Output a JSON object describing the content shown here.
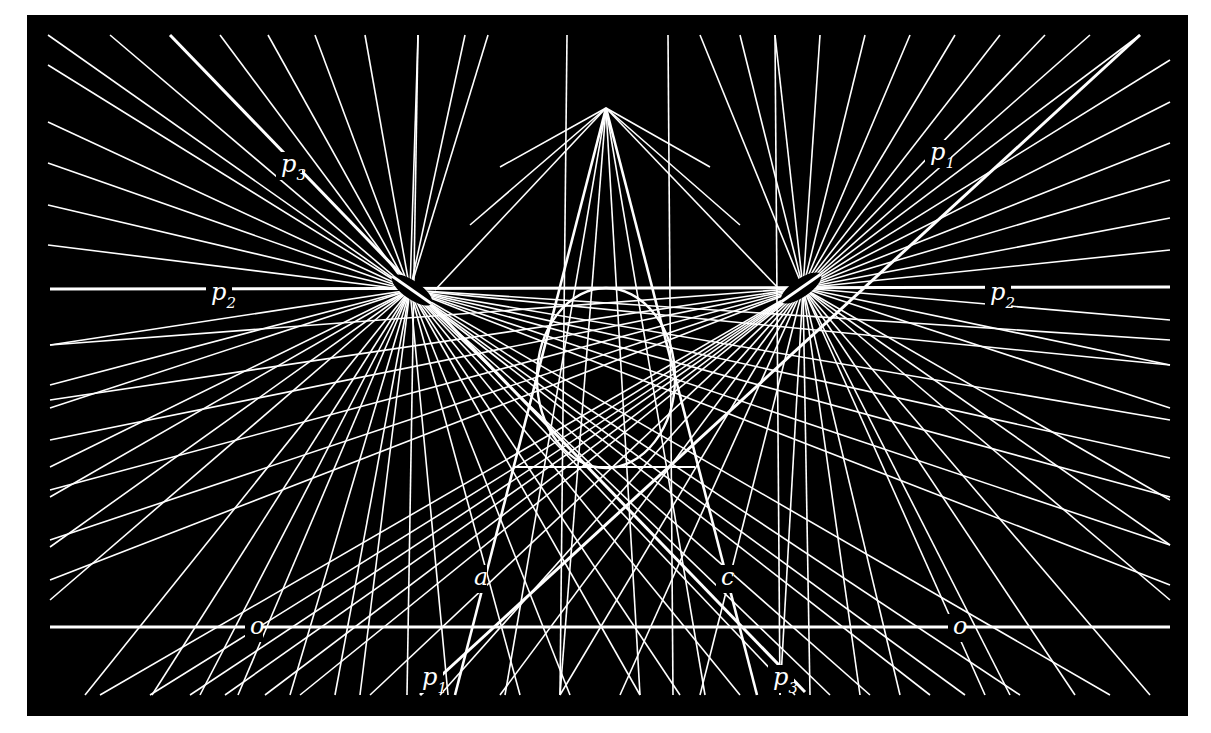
{
  "figure": {
    "background": "#ffffff",
    "panel": {
      "x": 27,
      "y": 15,
      "width": 1161,
      "height": 701,
      "color": "#000000"
    },
    "stroke_color": "#ffffff"
  },
  "points": {
    "pole_left": {
      "x": 410,
      "y": 290
    },
    "pole_right": {
      "x": 803,
      "y": 288
    },
    "apex": {
      "x": 606,
      "y": 108
    }
  },
  "pole_marks": [
    {
      "name": "pole-left-mark",
      "cx": 412,
      "cy": 290,
      "rx": 24,
      "ry": 9,
      "rotate": 35
    },
    {
      "name": "pole-right-mark",
      "cx": 801,
      "cy": 288,
      "rx": 24,
      "ry": 9,
      "rotate": -35
    }
  ],
  "ellipse": {
    "cx": 606,
    "cy": 378,
    "rx": 69,
    "ry": 90
  },
  "thick_lines": [
    {
      "name": "line-o",
      "x1": 50,
      "y1": 627,
      "x2": 1170,
      "y2": 627,
      "w": 3
    },
    {
      "name": "line-p2",
      "x1": 50,
      "y1": 289,
      "x2": 1170,
      "y2": 287,
      "w": 3
    },
    {
      "name": "line-p1",
      "x1": 420,
      "y1": 695,
      "x2": 1140,
      "y2": 35,
      "w": 3
    },
    {
      "name": "line-p3",
      "x1": 170,
      "y1": 35,
      "x2": 805,
      "y2": 692,
      "w": 3
    },
    {
      "name": "line-a",
      "x1": 455,
      "y1": 695,
      "x2": 606,
      "y2": 108,
      "w": 2.6
    },
    {
      "name": "line-c",
      "x1": 757,
      "y1": 695,
      "x2": 606,
      "y2": 108,
      "w": 2.6
    },
    {
      "name": "ellipse-top-tangent",
      "x1": 515,
      "y1": 467,
      "x2": 695,
      "y2": 467,
      "w": 2
    }
  ],
  "pencil_left_ends": [
    [
      48,
      35
    ],
    [
      110,
      35
    ],
    [
      220,
      35
    ],
    [
      268,
      35
    ],
    [
      315,
      35
    ],
    [
      365,
      35
    ],
    [
      418,
      35
    ],
    [
      465,
      35
    ],
    [
      488,
      35
    ],
    [
      48,
      65
    ],
    [
      48,
      122
    ],
    [
      48,
      163
    ],
    [
      48,
      205
    ],
    [
      48,
      245
    ],
    [
      50,
      345
    ],
    [
      50,
      385
    ],
    [
      50,
      408
    ],
    [
      50,
      467
    ],
    [
      50,
      497
    ],
    [
      50,
      547
    ],
    [
      50,
      600
    ],
    [
      85,
      695
    ],
    [
      152,
      695
    ],
    [
      200,
      695
    ],
    [
      238,
      695
    ],
    [
      290,
      695
    ],
    [
      335,
      695
    ],
    [
      360,
      695
    ],
    [
      448,
      695
    ],
    [
      520,
      695
    ],
    [
      1170,
      340
    ],
    [
      1170,
      365
    ],
    [
      1170,
      420
    ],
    [
      1170,
      458
    ],
    [
      1170,
      497
    ],
    [
      1170,
      545
    ],
    [
      1170,
      585
    ],
    [
      1110,
      695
    ],
    [
      1020,
      695
    ],
    [
      965,
      695
    ],
    [
      930,
      695
    ],
    [
      870,
      695
    ],
    [
      830,
      695
    ],
    [
      795,
      695
    ],
    [
      740,
      695
    ],
    [
      680,
      695
    ],
    [
      640,
      695
    ],
    [
      570,
      695
    ]
  ],
  "pencil_right_ends": [
    [
      1140,
      35
    ],
    [
      1090,
      35
    ],
    [
      1045,
      35
    ],
    [
      1000,
      35
    ],
    [
      955,
      35
    ],
    [
      910,
      35
    ],
    [
      865,
      35
    ],
    [
      820,
      35
    ],
    [
      775,
      35
    ],
    [
      740,
      35
    ],
    [
      700,
      35
    ],
    [
      1170,
      60
    ],
    [
      1170,
      102
    ],
    [
      1170,
      143
    ],
    [
      1170,
      180
    ],
    [
      1170,
      218
    ],
    [
      1170,
      250
    ],
    [
      1170,
      320
    ],
    [
      1170,
      365
    ],
    [
      1170,
      408
    ],
    [
      1170,
      500
    ],
    [
      1170,
      545
    ],
    [
      1170,
      600
    ],
    [
      1150,
      695
    ],
    [
      1075,
      695
    ],
    [
      1010,
      695
    ],
    [
      985,
      695
    ],
    [
      900,
      695
    ],
    [
      860,
      695
    ],
    [
      810,
      695
    ],
    [
      780,
      695
    ],
    [
      700,
      695
    ],
    [
      50,
      345
    ],
    [
      50,
      400
    ],
    [
      50,
      440
    ],
    [
      50,
      490
    ],
    [
      50,
      540
    ],
    [
      50,
      580
    ],
    [
      100,
      695
    ],
    [
      150,
      695
    ],
    [
      190,
      695
    ],
    [
      225,
      695
    ],
    [
      265,
      695
    ],
    [
      300,
      695
    ],
    [
      370,
      695
    ],
    [
      440,
      695
    ],
    [
      500,
      695
    ],
    [
      560,
      695
    ],
    [
      620,
      695
    ]
  ],
  "apex_rays": [
    [
      560,
      695
    ],
    [
      640,
      695
    ],
    [
      505,
      695
    ],
    [
      705,
      695
    ],
    [
      435,
      290
    ],
    [
      780,
      290
    ],
    [
      470,
      225
    ],
    [
      740,
      225
    ],
    [
      500,
      167
    ],
    [
      710,
      167
    ]
  ],
  "vertical_lines": [
    {
      "x1": 418,
      "y1": 35,
      "x2": 407,
      "y2": 695
    },
    {
      "x1": 567,
      "y1": 35,
      "x2": 560,
      "y2": 695
    },
    {
      "x1": 668,
      "y1": 35,
      "x2": 673,
      "y2": 695
    },
    {
      "x1": 775,
      "y1": 35,
      "x2": 780,
      "y2": 695
    }
  ],
  "labels": [
    {
      "name": "label-p3-top",
      "main": "p",
      "sub": "3",
      "x": 281,
      "y": 172
    },
    {
      "name": "label-p1-top",
      "main": "p",
      "sub": "1",
      "x": 930,
      "y": 160
    },
    {
      "name": "label-p2-left",
      "main": "p",
      "sub": "2",
      "x": 211,
      "y": 300
    },
    {
      "name": "label-p2-right",
      "main": "p",
      "sub": "2",
      "x": 990,
      "y": 300
    },
    {
      "name": "label-a",
      "main": "a",
      "sub": "",
      "x": 474,
      "y": 585
    },
    {
      "name": "label-c",
      "main": "c",
      "sub": "",
      "x": 721,
      "y": 585
    },
    {
      "name": "label-o-left",
      "main": "o",
      "sub": "",
      "x": 250,
      "y": 634
    },
    {
      "name": "label-o-right",
      "main": "o",
      "sub": "",
      "x": 953,
      "y": 634
    },
    {
      "name": "label-p1-bottom",
      "main": "p",
      "sub": "1",
      "x": 422,
      "y": 685
    },
    {
      "name": "label-p3-bottom",
      "main": "p",
      "sub": "3",
      "x": 773,
      "y": 685
    }
  ]
}
